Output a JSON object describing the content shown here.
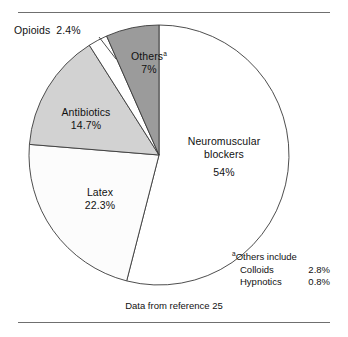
{
  "figure": {
    "caption": "Data from reference 25",
    "rules": {
      "top": true,
      "bottom": true
    }
  },
  "footnote": {
    "marker": "a",
    "heading": "Others include",
    "rows": [
      {
        "label": "Colloids",
        "value": "2.8%"
      },
      {
        "label": "Hypnotics",
        "value": "0.8%"
      }
    ]
  },
  "labels": {
    "opioids": {
      "name": "Opioids",
      "pct": "2.4%"
    },
    "others": {
      "name": "Others",
      "marker": "a",
      "pct": "7%"
    },
    "antibiotics": {
      "name": "Antibiotics",
      "pct": "14.7%"
    },
    "latex": {
      "name": "Latex",
      "pct": "22.3%"
    },
    "nmb": {
      "name_line1": "Neuromuscular",
      "name_line2": "blockers",
      "pct": "54%"
    }
  },
  "chart_data": {
    "type": "pie",
    "title": "",
    "subtitle": "",
    "xlabel": "",
    "ylabel": "",
    "legend": "none (labels placed on slices)",
    "start_angle_deg": 0,
    "direction": "clockwise",
    "units": "percent",
    "categories": [
      "Neuromuscular blockers",
      "Latex",
      "Antibiotics",
      "Opioids",
      "Others"
    ],
    "values": [
      54,
      22.3,
      14.7,
      2.4,
      7
    ],
    "slice_labels": [
      "54%",
      "22.3%",
      "14.7%",
      "2.4%",
      "7%"
    ],
    "colors": [
      "#ffffff",
      "#fcfcfc",
      "#d2d2d2",
      "#ffffff",
      "#9b9b9b"
    ],
    "edge_color": "#3a3a3a",
    "source": "Data from reference 25"
  },
  "geometry": {
    "cx": 159,
    "cy": 155,
    "r": 130,
    "slices": [
      {
        "key": "nmb",
        "start": 0,
        "end": 194.4,
        "fill": "#ffffff"
      },
      {
        "key": "latex",
        "start": 194.4,
        "end": 274.68,
        "fill": "#fcfcfc"
      },
      {
        "key": "antibiotics",
        "start": 274.68,
        "end": 327.6,
        "fill": "#d2d2d2"
      },
      {
        "key": "opioids",
        "start": 327.6,
        "end": 336.24,
        "fill": "#ffffff"
      },
      {
        "key": "others",
        "start": 336.24,
        "end": 360,
        "fill": "#9b9b9b"
      }
    ],
    "leader": {
      "x1": 99,
      "y1": 37,
      "x2": 116,
      "y2": 59
    }
  }
}
